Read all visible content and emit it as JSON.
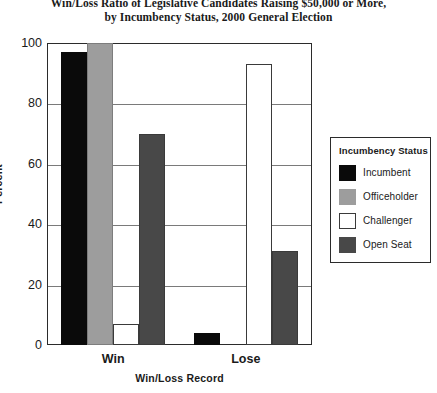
{
  "chart_data": {
    "type": "bar",
    "title_lines": [
      "Win/Loss Ratio of Legislative Candidates Raising $50,000 or More,",
      "by Incumbency Status, 2000 General Election"
    ],
    "xlabel": "Win/Loss Record",
    "ylabel": "Percent",
    "categories": [
      "Win",
      "Lose"
    ],
    "ylim": [
      0,
      100
    ],
    "yticks": [
      0,
      20,
      40,
      60,
      80,
      100
    ],
    "grid": true,
    "legend_position": "right",
    "legend_title": "Incumbency Status",
    "series": [
      {
        "name": "Incumbent",
        "color": "#0a0a0a",
        "values": [
          97,
          4
        ]
      },
      {
        "name": "Officeholder",
        "color": "#9d9d9d",
        "values": [
          100,
          0
        ]
      },
      {
        "name": "Challenger",
        "color": "#ffffff",
        "values": [
          7,
          93
        ]
      },
      {
        "name": "Open Seat",
        "color": "#484848",
        "values": [
          70,
          31
        ]
      }
    ]
  }
}
